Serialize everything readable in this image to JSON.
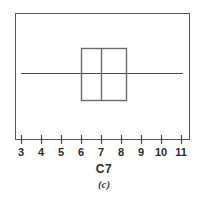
{
  "figure": {
    "caption": "(c)",
    "axis_title": "C7",
    "background_color": "#ffffff",
    "line_color": "#4a4a4a",
    "text_color": "#2b2b2b"
  },
  "chart_data": {
    "type": "box",
    "title": "",
    "subtitle": "(c)",
    "xlabel": "C7",
    "ylabel": "",
    "orientation": "horizontal",
    "grid": false,
    "legend": null,
    "xlim": [
      2.7,
      11.45
    ],
    "xticks": [
      3,
      4,
      5,
      6,
      7,
      8,
      9,
      10,
      11
    ],
    "xtick_labels": [
      "3",
      "4",
      "5",
      "6",
      "7",
      "8",
      "9",
      "10",
      "11"
    ],
    "boxes": [
      {
        "name": "C7",
        "whisker_low": 3.0,
        "q1": 6.0,
        "median": 7.0,
        "q3": 8.25,
        "whisker_high": 11.1,
        "outliers": []
      }
    ]
  },
  "geometry": {
    "frame": {
      "x": 15,
      "y": 13,
      "width": 175,
      "height": 127
    },
    "axis_y": 140,
    "tick_pixel_x": [
      21,
      41,
      61,
      81,
      101,
      121,
      141,
      161,
      181
    ],
    "tick_label_y": 146,
    "box_pixel": {
      "left": 80,
      "right": 126,
      "top": 48,
      "bottom": 100
    },
    "median_pixel_x": 101,
    "whisker_pixel": {
      "y": 73,
      "left": 21,
      "right": 183
    }
  }
}
